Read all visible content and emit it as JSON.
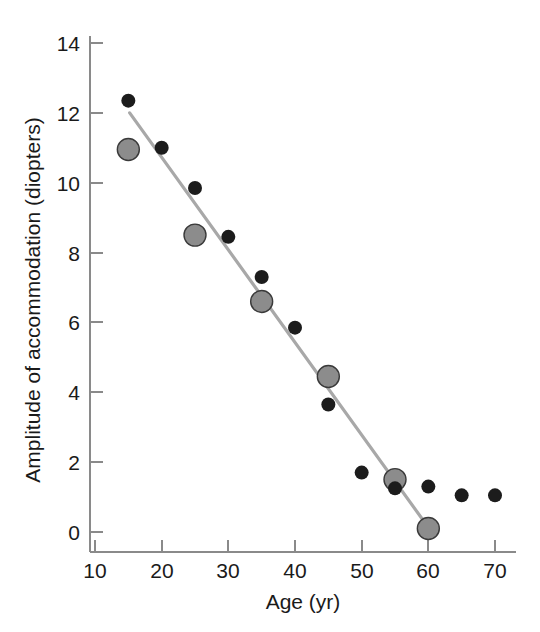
{
  "chart_data": {
    "type": "scatter",
    "title": "",
    "xlabel": "Age (yr)",
    "ylabel": "Amplitude of accommodation (diopters)",
    "xlim": [
      10,
      72
    ],
    "ylim": [
      0,
      14
    ],
    "xticks": [
      10,
      20,
      30,
      40,
      50,
      60,
      70
    ],
    "xtick_labels": [
      "10",
      "20",
      "30",
      "40",
      "50",
      "60",
      "70"
    ],
    "yticks": [
      0,
      2,
      4,
      6,
      8,
      10,
      12,
      14
    ],
    "ytick_labels": [
      "0",
      "2",
      "4",
      "6",
      "8",
      "10",
      "12",
      "14"
    ],
    "grid": false,
    "legend": "none",
    "series": [
      {
        "name": "individual-measurements",
        "marker": "small-black-circle",
        "color": "#1c1c1c",
        "marker_radius_px": 7,
        "points": [
          {
            "x": 15,
            "y": 12.35
          },
          {
            "x": 20,
            "y": 11.0
          },
          {
            "x": 25,
            "y": 9.85
          },
          {
            "x": 30,
            "y": 8.45
          },
          {
            "x": 35,
            "y": 7.3
          },
          {
            "x": 40,
            "y": 5.85
          },
          {
            "x": 45,
            "y": 3.65
          },
          {
            "x": 50,
            "y": 1.7
          },
          {
            "x": 55,
            "y": 1.25
          },
          {
            "x": 60,
            "y": 1.3
          },
          {
            "x": 65,
            "y": 1.05
          },
          {
            "x": 70,
            "y": 1.05
          }
        ]
      },
      {
        "name": "mean-values",
        "marker": "large-gray-circle",
        "color": "#8c8c8c",
        "marker_radius_px": 11,
        "points": [
          {
            "x": 15,
            "y": 10.95
          },
          {
            "x": 25,
            "y": 8.5
          },
          {
            "x": 35,
            "y": 6.6
          },
          {
            "x": 45,
            "y": 4.45
          },
          {
            "x": 55,
            "y": 1.5
          },
          {
            "x": 60,
            "y": 0.1
          }
        ]
      }
    ],
    "fit_line": {
      "name": "linear-regression-line",
      "color": "#a8a8a8",
      "x_start": 15.2,
      "y_start": 12.0,
      "x_end": 60.3,
      "y_end": 0.05
    }
  },
  "axes": {
    "x_axis_name": "age-axis",
    "y_axis_name": "amplitude-axis"
  }
}
